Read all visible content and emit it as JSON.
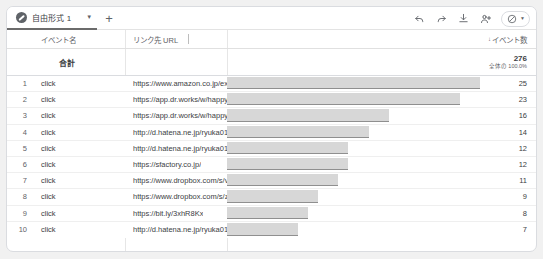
{
  "tab": {
    "label": "自由形式 1",
    "caret": "▼",
    "add": "+",
    "badge_icon": "pencil-circle-icon"
  },
  "toolbar": {
    "undo": "undo-icon",
    "redo": "redo-icon",
    "download": "download-icon",
    "share": "share-user-icon",
    "access": "restricted-circle-icon",
    "access_caret": "▼"
  },
  "table": {
    "headers": {
      "index": "",
      "event_name": "イベント名",
      "link_url": "リンク先 URL",
      "event_count": "イベント数",
      "sort_arrow": "↓"
    },
    "totals": {
      "label": "合計",
      "value": "276",
      "percent": "全体の 100.0%"
    },
    "rows": [
      {
        "index": "1",
        "event": "click",
        "url": "https://www.amazon.co.jp/ex...",
        "value": "25"
      },
      {
        "index": "2",
        "event": "click",
        "url": "https://app.dr.works/w/happya...",
        "value": "23"
      },
      {
        "index": "3",
        "event": "click",
        "url": "https://app.dr.works/w/happya...",
        "value": "16"
      },
      {
        "index": "4",
        "event": "click",
        "url": "http://d.hatena.ne.jp/ryuka01...",
        "value": "14"
      },
      {
        "index": "5",
        "event": "click",
        "url": "http://d.hatena.ne.jp/ryuka01...",
        "value": "12"
      },
      {
        "index": "6",
        "event": "click",
        "url": "https://sfactory.co.jp/",
        "value": "12"
      },
      {
        "index": "7",
        "event": "click",
        "url": "https://www.dropbox.com/s/v...",
        "value": "11"
      },
      {
        "index": "8",
        "event": "click",
        "url": "https://www.dropbox.com/s/zf...",
        "value": "9"
      },
      {
        "index": "9",
        "event": "click",
        "url": "https://bit.ly/3xhR8Kx",
        "value": "8"
      },
      {
        "index": "10",
        "event": "click",
        "url": "http://d.hatena.ne.jp/ryuka01...",
        "value": "7"
      }
    ]
  },
  "chart_data": {
    "type": "bar",
    "title": "イベント数",
    "orientation": "horizontal",
    "categories": [
      "https://www.amazon.co.jp/ex...",
      "https://app.dr.works/w/happya...",
      "https://app.dr.works/w/happya...",
      "http://d.hatena.ne.jp/ryuka01...",
      "http://d.hatena.ne.jp/ryuka01...",
      "https://sfactory.co.jp/",
      "https://www.dropbox.com/s/v...",
      "https://www.dropbox.com/s/zf...",
      "https://bit.ly/3xhR8Kx",
      "http://d.hatena.ne.jp/ryuka01..."
    ],
    "values": [
      25,
      23,
      16,
      14,
      12,
      12,
      11,
      9,
      8,
      7
    ],
    "xlabel": "イベント数",
    "ylabel": "リンク先 URL",
    "xlim": [
      0,
      25
    ],
    "total": 276,
    "grid": false,
    "legend": false,
    "bar_color": "#d7d7d7",
    "bar_edge_color": "#8f8f8f"
  },
  "colors": {
    "card_border": "#dadce0",
    "tab_underline": "#6b6b6b",
    "text": "#3c4043",
    "muted": "#5f6368",
    "page_bg": "#f1f1f1"
  }
}
